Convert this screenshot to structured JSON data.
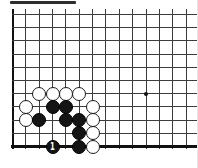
{
  "diagram": {
    "caption_bar": {
      "color": "#2e2e2e",
      "x": 10,
      "y": 1,
      "width": 66,
      "height": 3
    },
    "board": {
      "columns": 14,
      "rows": 10,
      "has_bottom_edge": true,
      "cropped_top": true,
      "cropped_right": true,
      "origin_x": 12.5,
      "origin_y": 14.5,
      "spacing_x": 13.35,
      "spacing_y": 13.2,
      "top_overhang_y": 9,
      "colors": {
        "background": "#ffffff",
        "grid_line": "#3c3c3c",
        "board_edge": "#111111",
        "black_stone": "#141414",
        "white_stone": "#ffffff",
        "stone_border": "#1a1a1a",
        "star_point": "#111111",
        "marker_text": "#ffffff"
      },
      "star_points": [
        {
          "col": 10,
          "row": 6
        }
      ],
      "stones": [
        {
          "col": 2,
          "row": 6,
          "color": "white"
        },
        {
          "col": 3,
          "row": 6,
          "color": "white"
        },
        {
          "col": 4,
          "row": 6,
          "color": "white"
        },
        {
          "col": 5,
          "row": 6,
          "color": "white"
        },
        {
          "col": 1,
          "row": 7,
          "color": "white"
        },
        {
          "col": 3,
          "row": 7,
          "color": "black"
        },
        {
          "col": 4,
          "row": 7,
          "color": "black"
        },
        {
          "col": 6,
          "row": 7,
          "color": "white"
        },
        {
          "col": 1,
          "row": 8,
          "color": "white"
        },
        {
          "col": 2,
          "row": 8,
          "color": "black"
        },
        {
          "col": 4,
          "row": 8,
          "color": "black"
        },
        {
          "col": 5,
          "row": 8,
          "color": "black"
        },
        {
          "col": 6,
          "row": 8,
          "color": "white"
        },
        {
          "col": 5,
          "row": 9,
          "color": "black"
        },
        {
          "col": 6,
          "row": 9,
          "color": "white"
        },
        {
          "col": 3,
          "row": 10,
          "color": "black",
          "label": "1"
        },
        {
          "col": 5,
          "row": 10,
          "color": "black"
        },
        {
          "col": 6,
          "row": 10,
          "color": "white"
        }
      ]
    }
  }
}
